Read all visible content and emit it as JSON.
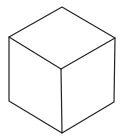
{
  "diagram": {
    "type": "isometric-cube-line-drawing",
    "title": "Cube",
    "stroke_color": "#222222",
    "background": "#ffffff",
    "vertices": {
      "top": [
        62,
        7
      ],
      "left_top": [
        9,
        37
      ],
      "right_top": [
        115,
        38
      ],
      "center": [
        61,
        69
      ],
      "left_bottom": [
        9,
        101
      ],
      "right_bottom": [
        114,
        102
      ],
      "bottom": [
        62,
        133
      ]
    }
  }
}
